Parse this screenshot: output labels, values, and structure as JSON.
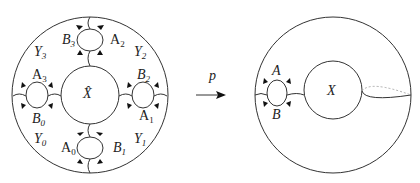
{
  "figure": {
    "left_surface": {
      "center_label": "X̂",
      "regions": [
        {
          "name": "Y",
          "sub": "3"
        },
        {
          "name": "Y",
          "sub": "2"
        },
        {
          "name": "Y",
          "sub": "0"
        },
        {
          "name": "Y",
          "sub": "1"
        }
      ],
      "handles": {
        "top": {
          "left": {
            "name": "B",
            "sub": "3"
          },
          "right": {
            "name": "A",
            "sub": "2"
          }
        },
        "left": {
          "top": {
            "name": "A",
            "sub": "3"
          },
          "bottom": {
            "name": "B",
            "sub": "0"
          }
        },
        "right": {
          "top": {
            "name": "B",
            "sub": "2"
          },
          "bottom": {
            "name": "A",
            "sub": "1"
          }
        },
        "bottom": {
          "left": {
            "name": "A",
            "sub": "0"
          },
          "right": {
            "name": "B",
            "sub": "1"
          }
        }
      }
    },
    "map": {
      "label": "p"
    },
    "right_surface": {
      "center_label": "X",
      "handle": {
        "top": "A",
        "bottom": "B"
      }
    }
  }
}
